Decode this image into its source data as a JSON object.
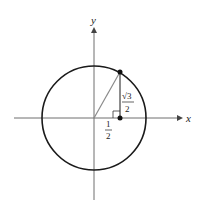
{
  "diagram": {
    "type": "unit-circle",
    "axis_labels": {
      "x": "x",
      "y": "y"
    },
    "point_label_x": {
      "numerator": "1",
      "denominator": "2"
    },
    "point_label_y": {
      "numerator": "√3",
      "denominator": "2"
    },
    "colors": {
      "circle": "#1a1a1a",
      "axes": "#6e6e6e",
      "radius": "#8a8a8a",
      "point": "#111111"
    }
  }
}
